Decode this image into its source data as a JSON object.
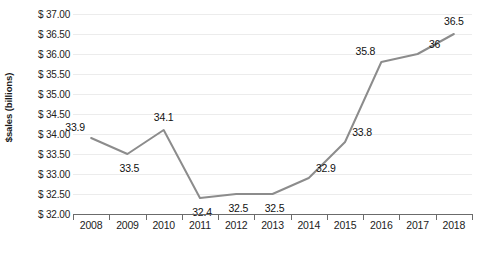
{
  "chart_data": {
    "type": "line",
    "title": "",
    "xlabel": "",
    "ylabel": "$sales (billions)",
    "categories": [
      "2008",
      "2009",
      "2010",
      "2011",
      "2012",
      "2013",
      "2014",
      "2015",
      "2016",
      "2017",
      "2018"
    ],
    "values": [
      33.9,
      33.5,
      34.1,
      32.4,
      32.5,
      32.5,
      32.9,
      33.8,
      35.8,
      36,
      36.5
    ],
    "point_labels": [
      "33.9",
      "33.5",
      "34.1",
      "32.4",
      "32.5",
      "32.5",
      "32.9",
      "33.8",
      "35.8",
      "36",
      "36.5"
    ],
    "label_positions": [
      "above-left",
      "below",
      "above",
      "below",
      "below",
      "below",
      "above-right",
      "above-right",
      "above-left",
      "above-right",
      "above"
    ],
    "ylim": [
      32.0,
      37.0
    ],
    "ytick_values": [
      37.0,
      36.5,
      36.0,
      35.5,
      35.0,
      34.5,
      34.0,
      33.5,
      33.0,
      32.5,
      32.0
    ],
    "ytick_labels": [
      "$ 37.00",
      "$ 36.50",
      "$ 36.00",
      "$ 35.50",
      "$ 35.00",
      "$ 34.50",
      "$ 34.00",
      "$ 33.50",
      "$ 33.00",
      "$ 32.50",
      "$ 32.00"
    ],
    "grid": true,
    "legend": false,
    "series_color": "#8c8c8c",
    "gridline_color": "#ececec",
    "axis_color": "#6b6b6b",
    "background_color": "#ffffff"
  }
}
